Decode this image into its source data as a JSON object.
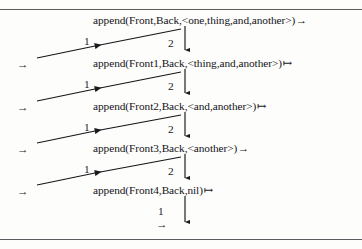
{
  "figure": {
    "kind": "prolog-append-recursion-trace",
    "border_color": "#5b5b5f",
    "ink_color": "#16161a",
    "background": "#fdfdfc"
  },
  "goals": [
    {
      "id": "goal-0",
      "text": "append(Front,Back,<one,thing,and,another>)",
      "out_arrow": "→",
      "x": 93,
      "y": 14
    },
    {
      "id": "goal-1",
      "text": "append(Front1,Back,<thing,and,another>)",
      "out_arrow": "↦",
      "x": 93,
      "y": 57
    },
    {
      "id": "goal-2",
      "text": "append(Front2,Back,<and,another>)",
      "out_arrow": "↦",
      "x": 93,
      "y": 100
    },
    {
      "id": "goal-3",
      "text": "append(Front3,Back,<another>)",
      "out_arrow": "→",
      "x": 93,
      "y": 142
    },
    {
      "id": "goal-4",
      "text": "append(Front4,Back,nil)",
      "out_arrow": "↦",
      "x": 93,
      "y": 184
    }
  ],
  "clause_labels": {
    "second_clause": "2",
    "first_clause": "1"
  },
  "descend_labels": [
    {
      "label": "2",
      "x": 168,
      "y": 38
    },
    {
      "label": "2",
      "x": 168,
      "y": 81
    },
    {
      "label": "2",
      "x": 168,
      "y": 124
    },
    {
      "label": "2",
      "x": 168,
      "y": 166
    }
  ],
  "return_labels": [
    {
      "label": "1",
      "x": 84,
      "y": 36
    },
    {
      "label": "1",
      "x": 84,
      "y": 79
    },
    {
      "label": "1",
      "x": 84,
      "y": 122
    },
    {
      "label": "1",
      "x": 84,
      "y": 164
    }
  ],
  "final": {
    "label": "1",
    "label_x": 158,
    "label_y": 206,
    "exit_arrow": "→",
    "exit_x": 156,
    "exit_y": 219
  },
  "entry_arrows": [
    {
      "glyph": "→",
      "x": 17,
      "y": 59
    },
    {
      "glyph": "→",
      "x": 17,
      "y": 102
    },
    {
      "glyph": "→",
      "x": 17,
      "y": 144
    },
    {
      "glyph": "→",
      "x": 17,
      "y": 186
    }
  ],
  "descend_paths": [
    {
      "x": 185,
      "y1": 26,
      "y2": 50
    },
    {
      "x": 185,
      "y1": 69,
      "y2": 93
    },
    {
      "x": 185,
      "y1": 112,
      "y2": 136
    },
    {
      "x": 185,
      "y1": 154,
      "y2": 178
    },
    {
      "x": 185,
      "y1": 196,
      "y2": 222
    }
  ],
  "return_paths": [
    {
      "x1": 181,
      "y1": 29,
      "x2": 95,
      "y2": 46
    },
    {
      "x1": 181,
      "y1": 72,
      "x2": 95,
      "y2": 89
    },
    {
      "x1": 181,
      "y1": 115,
      "x2": 95,
      "y2": 131
    },
    {
      "x1": 181,
      "y1": 157,
      "x2": 95,
      "y2": 173
    }
  ],
  "return_tails": [
    {
      "x1": 95,
      "y1": 46,
      "x2": 37,
      "y2": 58
    },
    {
      "x1": 95,
      "y1": 89,
      "x2": 37,
      "y2": 101
    },
    {
      "x1": 95,
      "y1": 131,
      "x2": 37,
      "y2": 143
    },
    {
      "x1": 95,
      "y1": 173,
      "x2": 37,
      "y2": 185
    }
  ]
}
